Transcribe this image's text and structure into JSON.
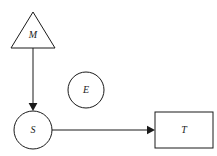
{
  "diagram": {
    "canvas": {
      "width": 217,
      "height": 156,
      "background": "#ffffff"
    },
    "style": {
      "stroke_color": "#1a1a1a",
      "fill_color": "#ffffff",
      "stroke_width": 1,
      "label_style": "italic serif"
    },
    "nodes": [
      {
        "id": "M",
        "label": "M",
        "shape": "triangle",
        "apex": {
          "x": 33,
          "y": 12
        },
        "base_left": {
          "x": 11,
          "y": 48
        },
        "base_right": {
          "x": 55,
          "y": 48
        },
        "label_position": {
          "x": 33,
          "y": 35
        }
      },
      {
        "id": "S",
        "label": "S",
        "shape": "circle",
        "center": {
          "x": 33,
          "y": 130
        },
        "radius": 19,
        "label_position": {
          "x": 33,
          "y": 130
        }
      },
      {
        "id": "E",
        "label": "E",
        "shape": "circle",
        "center": {
          "x": 86,
          "y": 90
        },
        "radius": 18,
        "label_position": {
          "x": 86,
          "y": 90
        }
      },
      {
        "id": "T",
        "label": "T",
        "shape": "rectangle",
        "x": 155,
        "y": 112,
        "width": 58,
        "height": 36,
        "label_position": {
          "x": 184,
          "y": 130
        }
      }
    ],
    "edges": [
      {
        "id": "M-to-S",
        "from": "M",
        "to": "S",
        "orientation": "vertical",
        "arrowhead": "end",
        "x1": 33,
        "y1": 48,
        "x2": 33,
        "y2": 110
      },
      {
        "id": "S-to-T",
        "from": "S",
        "to": "T",
        "orientation": "horizontal",
        "arrowhead": "end",
        "x1": 52,
        "y1": 130,
        "x2": 154,
        "y2": 130
      }
    ]
  }
}
